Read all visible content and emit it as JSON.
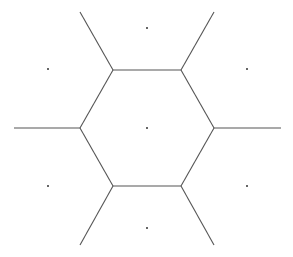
{
  "diagram": {
    "type": "voronoi",
    "edge_color": "#555555",
    "point_color": "#333333",
    "sites": [
      {
        "id": "center",
        "x": 147,
        "y": 128
      },
      {
        "id": "top",
        "x": 147,
        "y": 28
      },
      {
        "id": "bottom",
        "x": 147,
        "y": 228
      },
      {
        "id": "upper-left",
        "x": 48,
        "y": 69
      },
      {
        "id": "upper-right",
        "x": 247,
        "y": 69
      },
      {
        "id": "lower-left",
        "x": 48,
        "y": 186
      },
      {
        "id": "lower-right",
        "x": 247,
        "y": 186
      }
    ],
    "cell_edges": [
      {
        "x1": 113,
        "y1": 70,
        "x2": 181,
        "y2": 70
      },
      {
        "x1": 181,
        "y1": 70,
        "x2": 214,
        "y2": 128
      },
      {
        "x1": 214,
        "y1": 128,
        "x2": 181,
        "y2": 186
      },
      {
        "x1": 181,
        "y1": 186,
        "x2": 113,
        "y2": 186
      },
      {
        "x1": 113,
        "y1": 186,
        "x2": 80,
        "y2": 128
      },
      {
        "x1": 80,
        "y1": 128,
        "x2": 113,
        "y2": 70
      }
    ],
    "rays": [
      {
        "x1": 113,
        "y1": 70,
        "x2": 80,
        "y2": 12
      },
      {
        "x1": 181,
        "y1": 70,
        "x2": 214,
        "y2": 12
      },
      {
        "x1": 214,
        "y1": 128,
        "x2": 281,
        "y2": 128
      },
      {
        "x1": 181,
        "y1": 186,
        "x2": 214,
        "y2": 245
      },
      {
        "x1": 113,
        "y1": 186,
        "x2": 80,
        "y2": 245
      },
      {
        "x1": 80,
        "y1": 128,
        "x2": 14,
        "y2": 128
      }
    ]
  }
}
